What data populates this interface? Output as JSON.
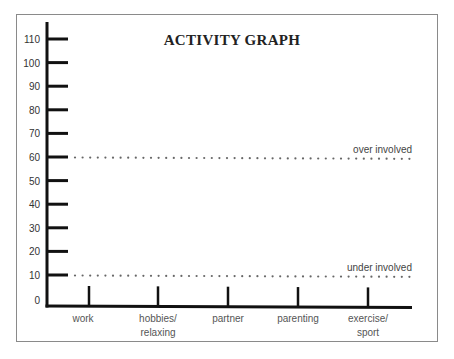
{
  "chart_data": {
    "type": "bar",
    "title": "ACTIVITY GRAPH",
    "xlabel": "",
    "ylabel": "",
    "categories": [
      "work",
      "hobbies/\nrelaxing",
      "partner",
      "parenting",
      "exercise/\nsport"
    ],
    "category_lines": [
      [
        "work"
      ],
      [
        "hobbies/",
        "relaxing"
      ],
      [
        "partner"
      ],
      [
        "parenting"
      ],
      [
        "exercise/",
        "sport"
      ]
    ],
    "values": [
      null,
      null,
      null,
      null,
      null
    ],
    "yticks": [
      0,
      10,
      20,
      30,
      40,
      50,
      60,
      70,
      80,
      90,
      100,
      110
    ],
    "ylim": [
      0,
      110
    ],
    "grid": false,
    "reference_lines": [
      {
        "label": "over involved",
        "y": 60,
        "style": "dotted"
      },
      {
        "label": "under involved",
        "y": 10,
        "style": "dotted"
      }
    ]
  },
  "colors": {
    "axis": "#111111",
    "frame": "#8a8a8a",
    "dots": "#666666",
    "text": "#333333"
  }
}
